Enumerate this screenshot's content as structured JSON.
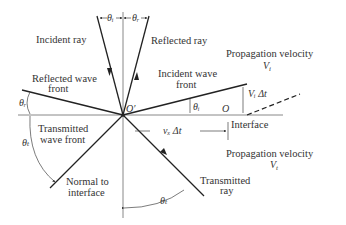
{
  "labels": {
    "incident_ray": "Incident ray",
    "reflected_ray": "Reflected ray",
    "reflected_wave_front_1": "Reflected wave",
    "reflected_wave_front_2": "front",
    "incident_wave_front_1": "Incident wave",
    "incident_wave_front_2": "front",
    "transmitted_wave_front_1": "Transmitted",
    "transmitted_wave_front_2": "wave front",
    "normal_1": "Normal to",
    "normal_2": "interface",
    "transmitted_ray_1": "Transmitted",
    "transmitted_ray_2": "ray",
    "interface": "Interface",
    "prop_velocity_top": "Propagation velocity",
    "vi": "V",
    "vi_sub": "i",
    "prop_velocity_bottom": "Propagation velocity",
    "vt": "V",
    "vt_sub": "t",
    "origin_prime": "O′",
    "origin": "O",
    "vi_dt": "Vᵢ Δt",
    "vx_dt": "vₓ  Δt",
    "theta_i": "θᵢ",
    "theta_r": "θᵣ",
    "theta_t": "θₜ"
  }
}
